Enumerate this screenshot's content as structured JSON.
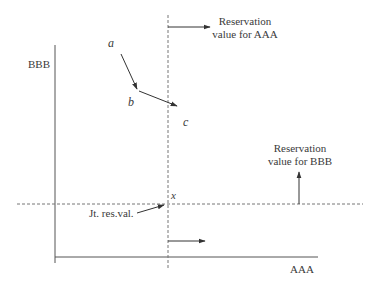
{
  "diagram": {
    "axes": {
      "y_label": "BBB",
      "x_label": "AAA"
    },
    "points": {
      "a": "a",
      "b": "b",
      "c": "c",
      "x": "x"
    },
    "annotations": {
      "res_aaa_line1": "Reservation",
      "res_aaa_line2": "value for AAA",
      "res_bbb_line1": "Reservation",
      "res_bbb_line2": "value for BBB",
      "joint": "Jt. res.val."
    },
    "colors": {
      "line": "#555555",
      "dashed": "#777777",
      "text": "#3a3a3a"
    }
  }
}
